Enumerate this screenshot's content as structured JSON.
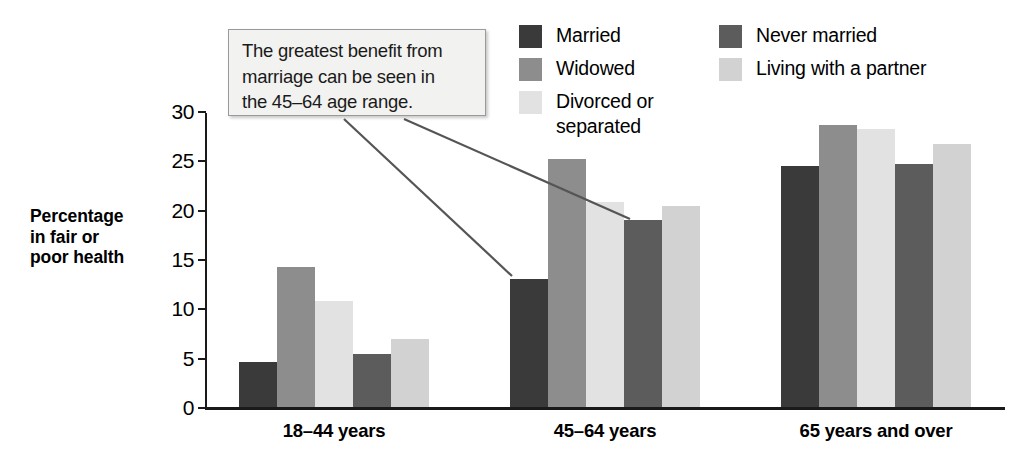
{
  "figure": {
    "background_color": "#ffffff",
    "axis_color": "#1a1a1a"
  },
  "annotation": {
    "text": "The greatest benefit from\nmarriage can be seen in\nthe 45–64 age range.",
    "box_fill": "#f2f2f0",
    "box_border": "#9a9a9a",
    "leader_color": "#555555"
  },
  "legend": {
    "columns": [
      {
        "items": [
          {
            "label": "Married",
            "color": "#3a3a3a"
          },
          {
            "label": "Widowed",
            "color": "#8d8d8d"
          },
          {
            "label": "Divorced or\nseparated",
            "color": "#e2e2e2"
          }
        ]
      },
      {
        "items": [
          {
            "label": "Never married",
            "color": "#5c5c5c"
          },
          {
            "label": "Living with a partner",
            "color": "#d2d2d2"
          }
        ]
      }
    ]
  },
  "chart_data": {
    "type": "bar",
    "title": "",
    "xlabel": "",
    "ylabel": "Percentage\nin fair or\npoor health",
    "ylabel_lines": [
      "Percentage",
      "in fair or",
      "poor health"
    ],
    "categories": [
      "18–44 years",
      "45–64 years",
      "65 years and over"
    ],
    "ylim": [
      0,
      30
    ],
    "yticks": [
      0,
      5,
      10,
      15,
      20,
      25,
      30
    ],
    "ytick_labels": [
      "0",
      "5",
      "10",
      "15",
      "20",
      "25",
      "30"
    ],
    "grid": false,
    "legend_position": "top-right",
    "series": [
      {
        "name": "Married",
        "color": "#3a3a3a",
        "values": [
          4.6,
          13.0,
          24.4
        ]
      },
      {
        "name": "Widowed",
        "color": "#8d8d8d",
        "values": [
          14.2,
          25.1,
          28.6
        ]
      },
      {
        "name": "Divorced or separated",
        "color": "#e2e2e2",
        "values": [
          10.7,
          20.8,
          28.2
        ]
      },
      {
        "name": "Never married",
        "color": "#5c5c5c",
        "values": [
          5.4,
          19.0,
          24.6
        ]
      },
      {
        "name": "Living with a partner",
        "color": "#d2d2d2",
        "values": [
          6.9,
          20.4,
          26.7
        ]
      }
    ]
  }
}
